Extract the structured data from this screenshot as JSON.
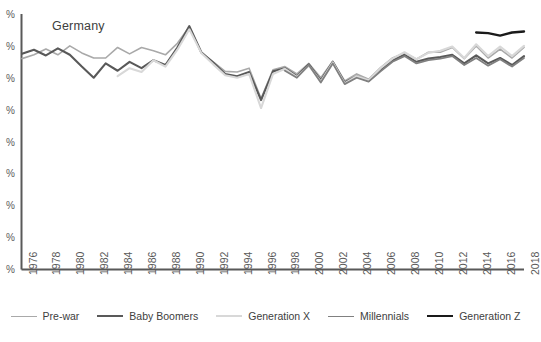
{
  "chart_data": {
    "type": "line",
    "title": "Germany",
    "xlabel": "",
    "ylabel": "",
    "grid": false,
    "legend_position": "bottom",
    "x": [
      1976,
      1977,
      1978,
      1979,
      1980,
      1981,
      1982,
      1983,
      1984,
      1985,
      1986,
      1987,
      1988,
      1989,
      1990,
      1991,
      1992,
      1993,
      1994,
      1995,
      1996,
      1997,
      1998,
      1999,
      2000,
      2001,
      2002,
      2003,
      2004,
      2005,
      2006,
      2007,
      2008,
      2009,
      2010,
      2011,
      2012,
      2013,
      2014,
      2015,
      2016,
      2017,
      2018
    ],
    "xticklabels": [
      "1976",
      "1978",
      "1980",
      "1982",
      "1984",
      "1986",
      "1988",
      "1990",
      "1992",
      "1994",
      "1996",
      "1998",
      "2000",
      "2002",
      "2004",
      "2006",
      "2008",
      "2010",
      "2012",
      "2014",
      "2016",
      "2018"
    ],
    "yticklabels": [
      "%",
      "%",
      "%",
      "%",
      "%",
      "%",
      "%",
      "%",
      "%"
    ],
    "ylim": [
      0,
      8
    ],
    "series": [
      {
        "name": "Pre-war",
        "color": "#a9a9a9",
        "width": 1.6,
        "x": [
          1976,
          1977,
          1978,
          1979,
          1980,
          1981,
          1982,
          1983,
          1984,
          1985,
          1986,
          1987,
          1988,
          1989,
          1990,
          1991,
          1992,
          1993,
          1994,
          1995,
          1996,
          1997,
          1998,
          1999,
          2000,
          2001,
          2002,
          2003,
          2004,
          2005,
          2006,
          2007,
          2008,
          2009,
          2010,
          2011,
          2012,
          2013,
          2014,
          2015,
          2016,
          2017,
          2018
        ],
        "values": [
          6.6,
          6.72,
          6.9,
          6.72,
          7.0,
          6.78,
          6.62,
          6.62,
          6.95,
          6.75,
          6.95,
          6.85,
          6.72,
          7.08,
          7.6,
          6.78,
          6.5,
          6.2,
          6.18,
          6.3,
          5.35,
          6.25,
          6.35,
          6.12,
          6.45,
          6.0,
          6.52,
          5.9,
          6.12,
          5.95,
          6.32,
          6.62,
          6.78,
          6.58,
          6.8,
          6.8,
          6.95,
          6.6,
          7.0,
          6.62,
          6.9,
          6.62,
          6.95
        ]
      },
      {
        "name": "Baby Boomers",
        "color": "#595959",
        "width": 2.1,
        "x": [
          1976,
          1977,
          1978,
          1979,
          1980,
          1981,
          1982,
          1983,
          1984,
          1985,
          1986,
          1987,
          1988,
          1989,
          1990,
          1991,
          1992,
          1993,
          1994,
          1995,
          1996,
          1997,
          1998,
          1999,
          2000,
          2001,
          2002,
          2003,
          2004,
          2005,
          2006,
          2007,
          2008,
          2009,
          2010,
          2011,
          2012,
          2013,
          2014,
          2015,
          2016,
          2017,
          2018
        ],
        "values": [
          6.75,
          6.88,
          6.7,
          6.92,
          6.72,
          6.35,
          6.0,
          6.45,
          6.22,
          6.5,
          6.3,
          6.55,
          6.4,
          6.95,
          7.62,
          6.8,
          6.48,
          6.12,
          6.05,
          6.18,
          5.3,
          6.2,
          6.3,
          6.05,
          6.42,
          5.92,
          6.5,
          5.85,
          6.05,
          5.9,
          6.25,
          6.55,
          6.72,
          6.5,
          6.6,
          6.65,
          6.72,
          6.45,
          6.7,
          6.45,
          6.62,
          6.4,
          6.68
        ]
      },
      {
        "name": "Generation X",
        "color": "#d8d8d8",
        "width": 2.1,
        "x": [
          1984,
          1985,
          1986,
          1987,
          1988,
          1989,
          1990,
          1991,
          1992,
          1993,
          1994,
          1995,
          1996,
          1997,
          1998,
          1999,
          2000,
          2001,
          2002,
          2003,
          2004,
          2005,
          2006,
          2007,
          2008,
          2009,
          2010,
          2011,
          2012,
          2013,
          2014,
          2015,
          2016,
          2017,
          2018
        ],
        "values": [
          6.05,
          6.3,
          6.18,
          6.55,
          6.35,
          6.88,
          7.52,
          6.78,
          6.42,
          6.08,
          6.0,
          6.12,
          5.05,
          6.12,
          6.28,
          6.02,
          6.38,
          5.88,
          6.48,
          5.82,
          6.05,
          5.92,
          6.3,
          6.6,
          6.8,
          6.58,
          6.78,
          6.85,
          6.98,
          6.62,
          7.05,
          6.68,
          6.98,
          6.68,
          7.0
        ]
      },
      {
        "name": "Millennials",
        "color": "#808080",
        "width": 1.8,
        "x": [
          1998,
          1999,
          2000,
          2001,
          2002,
          2003,
          2004,
          2005,
          2006,
          2007,
          2008,
          2009,
          2010,
          2011,
          2012,
          2013,
          2014,
          2015,
          2016,
          2017,
          2018
        ],
        "values": [
          6.22,
          6.0,
          6.4,
          5.85,
          6.45,
          5.8,
          6.0,
          5.88,
          6.2,
          6.5,
          6.68,
          6.45,
          6.55,
          6.6,
          6.68,
          6.4,
          6.62,
          6.38,
          6.58,
          6.35,
          6.62
        ]
      },
      {
        "name": "Generation Z",
        "color": "#1a1a1a",
        "width": 2.4,
        "x": [
          2014,
          2015,
          2016,
          2017,
          2018
        ],
        "values": [
          7.42,
          7.4,
          7.32,
          7.42,
          7.45
        ]
      }
    ]
  },
  "legend": {
    "items": [
      {
        "label": "Pre-war"
      },
      {
        "label": "Baby Boomers"
      },
      {
        "label": "Generation X"
      },
      {
        "label": "Millennials"
      },
      {
        "label": "Generation Z"
      }
    ]
  },
  "axes": {
    "axis_color": "#595959"
  }
}
